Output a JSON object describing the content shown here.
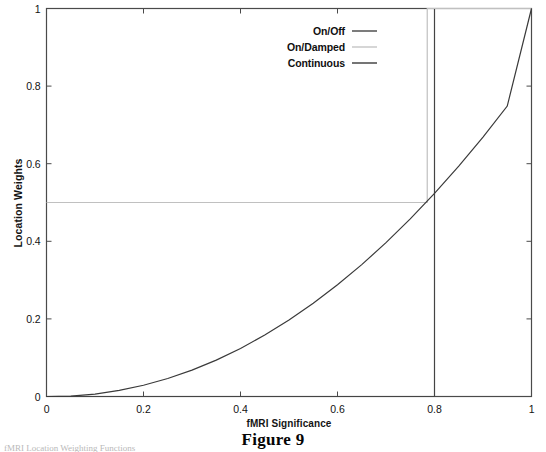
{
  "figure": {
    "caption": "Figure 9",
    "bottom_artifact_text": "fMRI Location Weighting Functions"
  },
  "chart_data": {
    "type": "line",
    "title": "",
    "xlabel": "fMRI Significance",
    "ylabel": "Location Weights",
    "xlim": [
      0,
      1
    ],
    "ylim": [
      0,
      1
    ],
    "grid": false,
    "legend_position": "top-center-right",
    "xticks": [
      "0",
      "0.2",
      "0.4",
      "0.6",
      "0.8",
      "1"
    ],
    "xtick_values": [
      0,
      0.2,
      0.4,
      0.6,
      0.8,
      1
    ],
    "yticks": [
      "0",
      "0.2",
      "0.4",
      "0.6",
      "0.8",
      "1"
    ],
    "ytick_values": [
      0,
      0.2,
      0.4,
      0.6,
      0.8,
      1
    ],
    "series": [
      {
        "name": "On/Off",
        "color": "#444444",
        "width": 1.2,
        "points": [
          [
            0,
            0
          ],
          [
            0.8,
            0
          ],
          [
            0.8,
            1
          ],
          [
            1,
            1
          ]
        ]
      },
      {
        "name": "On/Damped",
        "color": "#c0c0c0",
        "width": 1.2,
        "points": [
          [
            0,
            0.5
          ],
          [
            0.785,
            0.5
          ],
          [
            0.785,
            1
          ],
          [
            1,
            1
          ]
        ]
      },
      {
        "name": "Continuous",
        "color": "#3a3a3a",
        "width": 1.2,
        "exponent": 2.2,
        "points": [
          [
            0,
            0
          ],
          [
            0.05,
            0.0012
          ],
          [
            0.1,
            0.0063
          ],
          [
            0.15,
            0.0157
          ],
          [
            0.2,
            0.029
          ],
          [
            0.25,
            0.0464
          ],
          [
            0.3,
            0.068
          ],
          [
            0.35,
            0.0938
          ],
          [
            0.4,
            0.1239
          ],
          [
            0.45,
            0.1583
          ],
          [
            0.5,
            0.197
          ],
          [
            0.55,
            0.2402
          ],
          [
            0.6,
            0.2878
          ],
          [
            0.65,
            0.3399
          ],
          [
            0.7,
            0.3965
          ],
          [
            0.75,
            0.4577
          ],
          [
            0.8,
            0.5234
          ],
          [
            0.85,
            0.5938
          ],
          [
            0.9,
            0.6688
          ],
          [
            0.95,
            0.7485
          ],
          [
            1,
            1
          ]
        ]
      }
    ],
    "legend": [
      {
        "label": "On/Off",
        "color": "#444444"
      },
      {
        "label": "On/Damped",
        "color": "#c4c4c4"
      },
      {
        "label": "Continuous",
        "color": "#3a3a3a"
      }
    ]
  }
}
